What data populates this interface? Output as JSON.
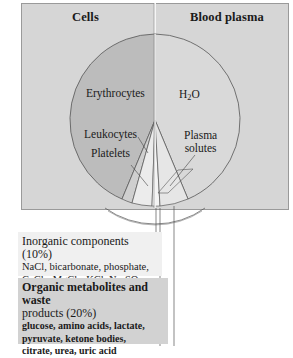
{
  "panel": {
    "left_header": "Cells",
    "right_header": "Blood plasma"
  },
  "pie": {
    "erythrocytes": "Erythrocytes",
    "water": "H",
    "water_sub": "2",
    "water_suffix": "O",
    "leukocytes": "Leukocytes",
    "platelets": "Platelets",
    "plasma_solutes_line1": "Plasma",
    "plasma_solutes_line2": "solutes"
  },
  "inorganic": {
    "title": "Inorganic components (10%)",
    "line1": "NaCl, bicarbonate, phosphate,",
    "line2_parts": [
      "CaCl",
      "2",
      ", MgCl",
      "2",
      ", KCl, Na",
      "2",
      "SO",
      "4"
    ]
  },
  "organic": {
    "title_line1": "Organic metabolites and waste",
    "title_line2": "products (20%)",
    "line1": "glucose, amino acids, lactate,",
    "line2": "pyruvate, ketone bodies,",
    "line3": "citrate, urea, uric acid"
  },
  "colors": {
    "panel": "#d6d6d6",
    "cells_fill": "#bdbdbd",
    "plasma_fill": "#d9d9d9",
    "slice_light": "#ececec",
    "outline": "#555555"
  }
}
